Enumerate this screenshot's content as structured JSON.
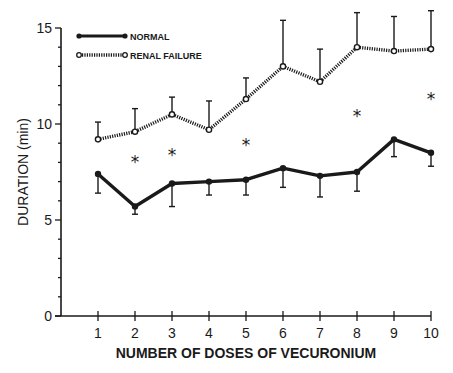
{
  "chart_data": {
    "type": "line",
    "title": "",
    "xlabel": "NUMBER OF DOSES OF VECURONIUM",
    "ylabel": "DURATION (min)",
    "x": [
      1,
      2,
      3,
      4,
      5,
      6,
      7,
      8,
      9,
      10
    ],
    "xlim": [
      0,
      10
    ],
    "ylim": [
      0,
      15
    ],
    "y_ticks_major": [
      0,
      5,
      10,
      15
    ],
    "y_ticks_minor_step": 1,
    "grid": false,
    "legend_position": "top-left",
    "series": [
      {
        "name": "NORMAL",
        "style": "solid thick line, filled circle markers",
        "values": [
          7.4,
          5.7,
          6.9,
          7.0,
          7.1,
          7.7,
          7.3,
          7.5,
          9.2,
          8.5
        ],
        "error_direction": "down",
        "error_bar_ends": [
          6.4,
          5.3,
          5.7,
          6.3,
          6.3,
          6.7,
          6.2,
          6.5,
          8.3,
          7.8
        ]
      },
      {
        "name": "RENAL FAILURE",
        "style": "dotted thick line, open circle markers",
        "values": [
          9.2,
          9.6,
          10.5,
          9.7,
          11.3,
          13.0,
          12.2,
          14.0,
          13.8,
          13.9
        ],
        "error_direction": "up",
        "error_bar_ends": [
          10.1,
          10.8,
          11.4,
          11.2,
          12.4,
          15.4,
          13.9,
          15.8,
          15.6,
          15.9
        ]
      }
    ],
    "annotations": [
      {
        "text": "*",
        "x": 2,
        "y": 8.1,
        "meaning": "significant difference"
      },
      {
        "text": "*",
        "x": 3,
        "y": 8.5,
        "meaning": "significant difference"
      },
      {
        "text": "*",
        "x": 5,
        "y": 9.0,
        "meaning": "significant difference"
      },
      {
        "text": "*",
        "x": 8,
        "y": 10.5,
        "meaning": "significant difference"
      },
      {
        "text": "*",
        "x": 10,
        "y": 11.4,
        "meaning": "significant difference"
      }
    ]
  },
  "legend": {
    "normal_label": "NORMAL",
    "renal_label": "RENAL FAILURE"
  },
  "colors": {
    "ink": "#1a1a1a",
    "background": "#ffffff"
  }
}
